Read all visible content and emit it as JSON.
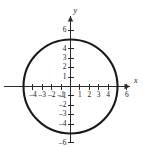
{
  "chart_data": {
    "type": "line",
    "title": "",
    "xlabel": "x",
    "ylabel": "y",
    "xlim": [
      -5.8,
      6.8
    ],
    "ylim": [
      -6.8,
      6.8
    ],
    "grid": false,
    "legend": "none",
    "annotations": [],
    "shapes": [
      {
        "kind": "circle",
        "center_x": 0,
        "center_y": 0,
        "radius": 5,
        "equation": "x^2 + y^2 = 25",
        "stroke": "#1a1a1a"
      }
    ],
    "x_ticks": [
      -5,
      -4,
      -3,
      -2,
      -1,
      0,
      1,
      2,
      3,
      4,
      5,
      6
    ],
    "x_tick_labels": [
      "",
      "-4",
      "-3",
      "-2",
      "-1",
      "",
      "1",
      "2",
      "3",
      "4",
      "",
      "6"
    ],
    "y_ticks": [
      -6,
      -5,
      -4,
      -3,
      -2,
      -1,
      0,
      1,
      2,
      3,
      4,
      5,
      6
    ],
    "y_tick_labels": [
      "-6",
      "",
      "-4",
      "-3",
      "-2",
      "-1",
      "",
      "1",
      "2",
      "3",
      "4",
      "",
      "6"
    ],
    "series": [
      {
        "name": "circle-radius-5",
        "x": [
          5,
          4.33,
          2.5,
          0,
          -2.5,
          -4.33,
          -5,
          -4.33,
          -2.5,
          0,
          2.5,
          4.33,
          5
        ],
        "y": [
          0,
          2.5,
          4.33,
          5,
          4.33,
          2.5,
          0,
          -2.5,
          -4.33,
          -5,
          -4.33,
          -2.5,
          0
        ]
      }
    ]
  },
  "axes": {
    "x_axis_name": "x",
    "y_axis_name": "y",
    "x_tick_entries": [
      {
        "value": -5,
        "label": ""
      },
      {
        "value": -4,
        "label": "-4"
      },
      {
        "value": -3,
        "label": "-3"
      },
      {
        "value": -2,
        "label": "-2"
      },
      {
        "value": -1,
        "label": "-1"
      },
      {
        "value": 1,
        "label": "1"
      },
      {
        "value": 2,
        "label": "2"
      },
      {
        "value": 3,
        "label": "3"
      },
      {
        "value": 4,
        "label": "4"
      },
      {
        "value": 5,
        "label": ""
      },
      {
        "value": 6,
        "label": "6"
      }
    ],
    "y_tick_entries": [
      {
        "value": 6,
        "label": "6"
      },
      {
        "value": 5,
        "label": ""
      },
      {
        "value": 4,
        "label": "4"
      },
      {
        "value": 3,
        "label": "3"
      },
      {
        "value": 2,
        "label": "2"
      },
      {
        "value": 1,
        "label": "1"
      },
      {
        "value": -1,
        "label": "-1"
      },
      {
        "value": -2,
        "label": "-2"
      },
      {
        "value": -3,
        "label": "-3"
      },
      {
        "value": -4,
        "label": "-4"
      },
      {
        "value": -5,
        "label": ""
      },
      {
        "value": -6,
        "label": "-6"
      }
    ]
  },
  "colors": {
    "background": "#ffffff",
    "axis": "#2b2b2b",
    "curve": "#1a1a1a",
    "text": "#1a1a1a"
  }
}
